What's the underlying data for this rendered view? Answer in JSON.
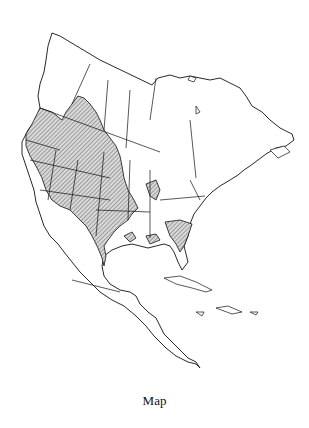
{
  "figure": {
    "caption": "Map",
    "type": "range-map",
    "region": "North America",
    "legend": {
      "hatched": "range"
    },
    "colors": {
      "outline": "#111111",
      "hatch_fill": "#d8d8d8",
      "background": "#ffffff"
    },
    "label_small": "70"
  }
}
